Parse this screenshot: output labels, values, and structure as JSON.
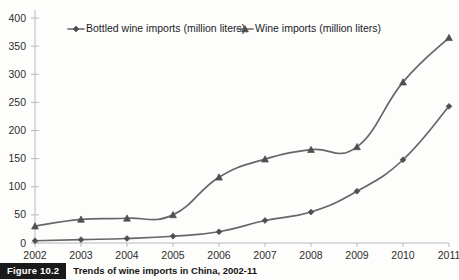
{
  "figure": {
    "badge": "Figure 10.2",
    "caption": "Trends of wine imports in China, 2002-11"
  },
  "colors": {
    "line": "#676767",
    "marker": "#4f4f4f",
    "axis": "#b9b9b9",
    "text": "#2e2e2e",
    "background": "#fdfdfc"
  },
  "chart_data": {
    "type": "line",
    "title": "",
    "xlabel": "",
    "ylabel": "",
    "categories": [
      "2002",
      "2003",
      "2004",
      "2005",
      "2006",
      "2007",
      "2008",
      "2009",
      "2010",
      "2011"
    ],
    "ylim": [
      0,
      400
    ],
    "yticks": [
      0,
      50,
      100,
      150,
      200,
      250,
      300,
      350,
      400
    ],
    "grid": false,
    "legend_position": "top",
    "series": [
      {
        "name": "Bottled wine imports (million liters)",
        "marker": "diamond",
        "values": [
          4,
          6,
          8,
          12,
          20,
          40,
          55,
          92,
          148,
          243
        ]
      },
      {
        "name": "Wine imports (million liters)",
        "marker": "triangle",
        "values": [
          30,
          42,
          44,
          50,
          117,
          149,
          166,
          171,
          286,
          365
        ]
      }
    ]
  }
}
